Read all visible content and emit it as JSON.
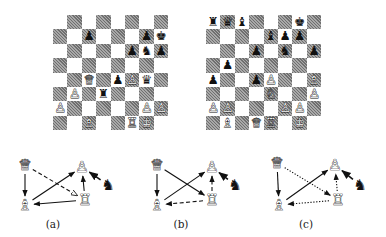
{
  "boards": [
    {
      "id": "board-a",
      "left": 53,
      "top": 15,
      "pieces": [
        {
          "sq": "c7",
          "piece": "pawn",
          "color": "black",
          "glyph": "♟"
        },
        {
          "sq": "g7",
          "piece": "pawn",
          "color": "black",
          "glyph": "♟"
        },
        {
          "sq": "h7",
          "piece": "king",
          "color": "black",
          "glyph": "♚"
        },
        {
          "sq": "f6",
          "piece": "pawn",
          "color": "black",
          "glyph": "♟"
        },
        {
          "sq": "g6",
          "piece": "knight",
          "color": "black",
          "glyph": "♞"
        },
        {
          "sq": "h6",
          "piece": "pawn",
          "color": "black",
          "glyph": "♟"
        },
        {
          "sq": "c4",
          "piece": "queen",
          "color": "white",
          "glyph": "♕"
        },
        {
          "sq": "e4",
          "piece": "pawn",
          "color": "black",
          "glyph": "♟"
        },
        {
          "sq": "f4",
          "piece": "pawn",
          "color": "white",
          "glyph": "♙"
        },
        {
          "sq": "g4",
          "piece": "queen",
          "color": "black",
          "glyph": "♛"
        },
        {
          "sq": "b3",
          "piece": "pawn",
          "color": "white",
          "glyph": "♙"
        },
        {
          "sq": "d3",
          "piece": "rook",
          "color": "black",
          "glyph": "♜"
        },
        {
          "sq": "a2",
          "piece": "pawn",
          "color": "white",
          "glyph": "♙"
        },
        {
          "sq": "g2",
          "piece": "pawn",
          "color": "white",
          "glyph": "♙"
        },
        {
          "sq": "h2",
          "piece": "pawn",
          "color": "white",
          "glyph": "♙"
        },
        {
          "sq": "c1",
          "piece": "bishop",
          "color": "white",
          "glyph": "♗"
        },
        {
          "sq": "f1",
          "piece": "rook",
          "color": "white",
          "glyph": "♖"
        },
        {
          "sq": "g1",
          "piece": "king",
          "color": "white",
          "glyph": "♔"
        }
      ]
    },
    {
      "id": "board-b",
      "left": 206,
      "top": 15,
      "pieces": [
        {
          "sq": "a8",
          "piece": "rook",
          "color": "black",
          "glyph": "♜"
        },
        {
          "sq": "b8",
          "piece": "queen",
          "color": "black",
          "glyph": "♛"
        },
        {
          "sq": "c8",
          "piece": "bishop",
          "color": "black",
          "glyph": "♝"
        },
        {
          "sq": "g8",
          "piece": "king",
          "color": "black",
          "glyph": "♚"
        },
        {
          "sq": "e7",
          "piece": "bishop",
          "color": "black",
          "glyph": "♝"
        },
        {
          "sq": "f7",
          "piece": "pawn",
          "color": "black",
          "glyph": "♟"
        },
        {
          "sq": "g7",
          "piece": "pawn",
          "color": "black",
          "glyph": "♟"
        },
        {
          "sq": "d6",
          "piece": "pawn",
          "color": "black",
          "glyph": "♟"
        },
        {
          "sq": "f6",
          "piece": "knight",
          "color": "black",
          "glyph": "♞"
        },
        {
          "sq": "h6",
          "piece": "pawn",
          "color": "black",
          "glyph": "♟"
        },
        {
          "sq": "b5",
          "piece": "pawn",
          "color": "black",
          "glyph": "♟"
        },
        {
          "sq": "a4",
          "piece": "pawn",
          "color": "black",
          "glyph": "♟"
        },
        {
          "sq": "d4",
          "piece": "pawn",
          "color": "black",
          "glyph": "♟"
        },
        {
          "sq": "e4",
          "piece": "pawn",
          "color": "white",
          "glyph": "♙"
        },
        {
          "sq": "h4",
          "piece": "bishop",
          "color": "white",
          "glyph": "♗"
        },
        {
          "sq": "e3",
          "piece": "knight",
          "color": "white",
          "glyph": "♘"
        },
        {
          "sq": "h3",
          "piece": "pawn",
          "color": "white",
          "glyph": "♙"
        },
        {
          "sq": "a2",
          "piece": "pawn",
          "color": "white",
          "glyph": "♙"
        },
        {
          "sq": "b2",
          "piece": "pawn",
          "color": "white",
          "glyph": "♙"
        },
        {
          "sq": "f2",
          "piece": "pawn",
          "color": "white",
          "glyph": "♙"
        },
        {
          "sq": "g2",
          "piece": "pawn",
          "color": "white",
          "glyph": "♙"
        },
        {
          "sq": "b1",
          "piece": "bishop",
          "color": "white",
          "glyph": "♗"
        },
        {
          "sq": "d1",
          "piece": "queen",
          "color": "white",
          "glyph": "♕"
        },
        {
          "sq": "e1",
          "piece": "rook",
          "color": "white",
          "glyph": "♖"
        },
        {
          "sq": "g1",
          "piece": "king",
          "color": "white",
          "glyph": "♔"
        }
      ]
    }
  ],
  "diagrams": [
    {
      "label": "(a)",
      "nodes": {
        "queen": {
          "x": 25,
          "y": 25,
          "glyph": "♕"
        },
        "bishop": {
          "x": 25,
          "y": 65,
          "glyph": "♗"
        },
        "pawn": {
          "x": 82,
          "y": 27,
          "glyph": "♙"
        },
        "rook": {
          "x": 85,
          "y": 60,
          "glyph": "♖"
        },
        "knight": {
          "x": 108,
          "y": 45,
          "glyph": "♞"
        }
      },
      "edges": [
        {
          "from": "queen",
          "to": "bishop",
          "style": "solid"
        },
        {
          "from": "queen",
          "to": "rook",
          "style": "dashed"
        },
        {
          "from": "bishop",
          "to": "pawn",
          "style": "solid"
        },
        {
          "from": "rook",
          "to": "bishop",
          "style": "solid"
        },
        {
          "from": "rook",
          "to": "pawn",
          "style": "solid"
        },
        {
          "from": "knight",
          "to": "pawn",
          "style": "solid"
        }
      ]
    },
    {
      "label": "(b)",
      "nodes": {
        "queen": {
          "x": 157,
          "y": 25,
          "glyph": "♕"
        },
        "bishop": {
          "x": 157,
          "y": 65,
          "glyph": "♗"
        },
        "pawn": {
          "x": 212,
          "y": 27,
          "glyph": "♙"
        },
        "rook": {
          "x": 212,
          "y": 60,
          "glyph": "♖"
        },
        "knight": {
          "x": 235,
          "y": 45,
          "glyph": "♞"
        }
      },
      "edges": [
        {
          "from": "queen",
          "to": "bishop",
          "style": "solid"
        },
        {
          "from": "queen",
          "to": "rook",
          "style": "solid"
        },
        {
          "from": "bishop",
          "to": "pawn",
          "style": "solid"
        },
        {
          "from": "rook",
          "to": "bishop",
          "style": "dashed"
        },
        {
          "from": "rook",
          "to": "pawn",
          "style": "dashed"
        },
        {
          "from": "knight",
          "to": "pawn",
          "style": "solid"
        }
      ]
    },
    {
      "label": "(c)",
      "nodes": {
        "queen": {
          "x": 277,
          "y": 23,
          "glyph": "♕"
        },
        "bishop": {
          "x": 279,
          "y": 65,
          "glyph": "♗"
        },
        "pawn": {
          "x": 335,
          "y": 25,
          "glyph": "♙"
        },
        "rook": {
          "x": 338,
          "y": 60,
          "glyph": "♖"
        },
        "knight": {
          "x": 360,
          "y": 45,
          "glyph": "♞"
        }
      },
      "edges": [
        {
          "from": "queen",
          "to": "bishop",
          "style": "solid"
        },
        {
          "from": "queen",
          "to": "rook",
          "style": "dotted"
        },
        {
          "from": "bishop",
          "to": "pawn",
          "style": "solid"
        },
        {
          "from": "rook",
          "to": "bishop",
          "style": "dotted"
        },
        {
          "from": "rook",
          "to": "pawn",
          "style": "dotted"
        },
        {
          "from": "knight",
          "to": "pawn",
          "style": "solid"
        }
      ]
    }
  ],
  "labels": {
    "a": "(a)",
    "b": "(b)",
    "c": "(c)"
  }
}
